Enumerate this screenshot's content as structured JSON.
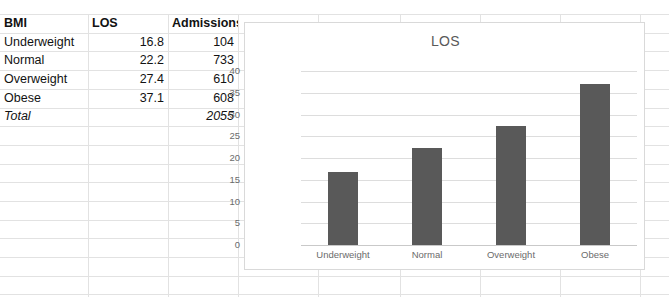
{
  "table": {
    "headers": [
      "BMI",
      "LOS",
      "Admissions"
    ],
    "rows": [
      {
        "bmi": "Underweight",
        "los": "16.8",
        "admissions": "104"
      },
      {
        "bmi": "Normal",
        "los": "22.2",
        "admissions": "733"
      },
      {
        "bmi": "Overweight",
        "los": "27.4",
        "admissions": "610"
      },
      {
        "bmi": "Obese",
        "los": "37.1",
        "admissions": "608"
      }
    ],
    "total": {
      "bmi": "Total",
      "los": "",
      "admissions": "2055"
    }
  },
  "chart_data": {
    "type": "bar",
    "title": "LOS",
    "categories": [
      "Underweight",
      "Normal",
      "Overweight",
      "Obese"
    ],
    "values": [
      16.8,
      22.2,
      27.4,
      37.1
    ],
    "yticks": [
      "0",
      "5",
      "10",
      "15",
      "20",
      "25",
      "30",
      "35",
      "40"
    ],
    "ylim": [
      0,
      40
    ],
    "xlabel": "",
    "ylabel": "",
    "grid": true,
    "legend": false,
    "bar_color": "#595959"
  }
}
